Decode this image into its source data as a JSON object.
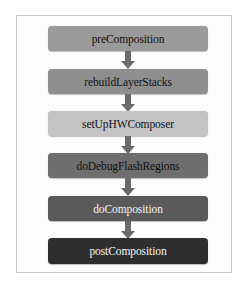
{
  "diagram": {
    "type": "flowchart",
    "direction": "top-to-bottom",
    "steps": [
      {
        "label": "preComposition",
        "fill": "#9a9a9a",
        "text_color": "#111111"
      },
      {
        "label": "rebuildLayerStacks",
        "fill": "#8f8f8f",
        "text_color": "#111111"
      },
      {
        "label": "setUpHWComposer",
        "fill": "#c4c4c4",
        "text_color": "#111111"
      },
      {
        "label": "doDebugFlashRegions",
        "fill": "#6e6e6e",
        "text_color": "#111111"
      },
      {
        "label": "doComposition",
        "fill": "#5a5a5a",
        "text_color": "#f2f2f2"
      },
      {
        "label": "postComposition",
        "fill": "#2e2e2e",
        "text_color": "#f5f5f5"
      }
    ],
    "edges": [
      {
        "from": "preComposition",
        "to": "rebuildLayerStacks"
      },
      {
        "from": "rebuildLayerStacks",
        "to": "setUpHWComposer"
      },
      {
        "from": "setUpHWComposer",
        "to": "doDebugFlashRegions"
      },
      {
        "from": "doDebugFlashRegions",
        "to": "doComposition"
      },
      {
        "from": "doComposition",
        "to": "postComposition"
      }
    ],
    "arrow_color": "#6a6a6a",
    "frame_border_color": "#c8c8c8"
  }
}
